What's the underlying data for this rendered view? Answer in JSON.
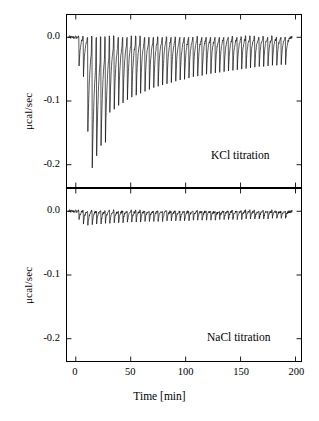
{
  "figure": {
    "xlabel": "Time [min]",
    "xticks": [
      "0",
      "50",
      "100",
      "150",
      "200"
    ],
    "xticks_values": [
      0,
      50,
      100,
      150,
      200
    ],
    "xlim": [
      -8,
      205
    ],
    "yticks": [
      "0.0",
      "-0.1",
      "-0.2"
    ],
    "yticks_values": [
      0.0,
      -0.1,
      -0.2
    ],
    "ylim": [
      -0.235,
      0.035
    ],
    "ylabel": "μcal/sec"
  },
  "panels": {
    "top": {
      "note": "KCl titration",
      "ylabel": "μcal/sec"
    },
    "bottom": {
      "note": "NaCl titration",
      "ylabel": "μcal/sec"
    }
  },
  "chart_data": [
    {
      "type": "line",
      "title": "KCl titration",
      "xlabel": "Time [min]",
      "ylabel": "μcal/sec",
      "xlim": [
        -8,
        205
      ],
      "ylim": [
        -0.235,
        0.035
      ],
      "grid": false,
      "legend": "none",
      "series": [
        {
          "name": "KCl titration raw ITC trace",
          "baseline": 0.0,
          "peak_times": [
            3,
            7,
            11,
            15,
            19,
            23,
            27,
            31,
            35,
            39,
            43,
            47,
            51,
            55,
            59,
            63,
            67,
            71,
            75,
            79,
            83,
            87,
            91,
            95,
            99,
            103,
            107,
            111,
            115,
            119,
            123,
            127,
            131,
            135,
            139,
            143,
            147,
            151,
            155,
            159,
            163,
            167,
            171,
            175,
            179,
            183,
            187,
            191
          ],
          "peak_depths": [
            -0.045,
            -0.062,
            -0.148,
            -0.205,
            -0.186,
            -0.17,
            -0.165,
            -0.118,
            -0.113,
            -0.107,
            -0.103,
            -0.098,
            -0.094,
            -0.091,
            -0.088,
            -0.085,
            -0.082,
            -0.079,
            -0.077,
            -0.075,
            -0.073,
            -0.071,
            -0.069,
            -0.067,
            -0.066,
            -0.064,
            -0.062,
            -0.061,
            -0.06,
            -0.058,
            -0.057,
            -0.056,
            -0.055,
            -0.054,
            -0.053,
            -0.052,
            -0.051,
            -0.05,
            -0.049,
            -0.048,
            -0.047,
            -0.046,
            -0.046,
            -0.045,
            -0.044,
            -0.044,
            -0.043,
            -0.043
          ]
        }
      ]
    },
    {
      "type": "line",
      "title": "NaCl titration",
      "xlabel": "Time [min]",
      "ylabel": "μcal/sec",
      "xlim": [
        -8,
        205
      ],
      "ylim": [
        -0.235,
        0.035
      ],
      "grid": false,
      "legend": "none",
      "series": [
        {
          "name": "NaCl titration raw ITC trace",
          "baseline": 0.0,
          "peak_times": [
            3,
            7,
            11,
            15,
            19,
            23,
            27,
            31,
            35,
            39,
            43,
            47,
            51,
            55,
            59,
            63,
            67,
            71,
            75,
            79,
            83,
            87,
            91,
            95,
            99,
            103,
            107,
            111,
            115,
            119,
            123,
            127,
            131,
            135,
            139,
            143,
            147,
            151,
            155,
            159,
            163,
            167,
            171,
            175,
            179,
            183,
            187,
            191
          ],
          "peak_depths": [
            -0.013,
            -0.02,
            -0.022,
            -0.021,
            -0.02,
            -0.02,
            -0.019,
            -0.019,
            -0.018,
            -0.018,
            -0.018,
            -0.017,
            -0.017,
            -0.017,
            -0.017,
            -0.016,
            -0.016,
            -0.016,
            -0.016,
            -0.016,
            -0.015,
            -0.015,
            -0.015,
            -0.015,
            -0.015,
            -0.015,
            -0.014,
            -0.014,
            -0.014,
            -0.014,
            -0.014,
            -0.014,
            -0.013,
            -0.013,
            -0.013,
            -0.013,
            -0.013,
            -0.013,
            -0.012,
            -0.012,
            -0.012,
            -0.012,
            -0.012,
            -0.012,
            -0.011,
            -0.011,
            -0.011,
            -0.011
          ]
        }
      ]
    }
  ]
}
